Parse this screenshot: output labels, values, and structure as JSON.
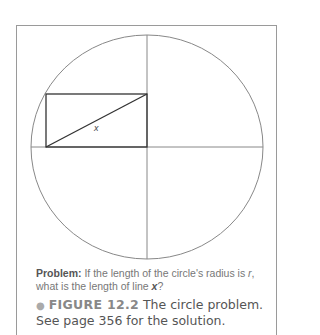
{
  "figure": {
    "x_label": "x",
    "circle": {
      "cx": 147,
      "cy": 147,
      "rx": 116,
      "ry": 112
    },
    "rectangle": {
      "x": 46,
      "y": 94,
      "width": 101,
      "height": 53
    }
  },
  "problem": {
    "label": "Problem:",
    "text_before_r": " If the length of the circle's radius is ",
    "r": "r",
    "text_after_r": ", what is the length of line ",
    "x": "x",
    "end": "?"
  },
  "caption": {
    "bullet": "●",
    "label": "FIGURE 12.2",
    "text": "  The circle problem. See page 356 for the solution."
  }
}
